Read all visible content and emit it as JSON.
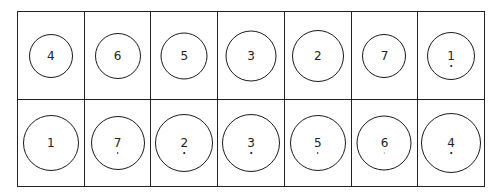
{
  "grid": {
    "rows": [
      {
        "cells": [
          {
            "label": "4",
            "diameter": 44,
            "dot": false
          },
          {
            "label": "6",
            "diameter": 46,
            "dot": false
          },
          {
            "label": "5",
            "diameter": 47,
            "dot": false
          },
          {
            "label": "3",
            "diameter": 51,
            "dot": false
          },
          {
            "label": "2",
            "diameter": 52,
            "dot": false
          },
          {
            "label": "7",
            "diameter": 44,
            "dot": false
          },
          {
            "label": "1",
            "diameter": 48,
            "dot": true
          }
        ]
      },
      {
        "cells": [
          {
            "label": "1",
            "diameter": 56,
            "dot": false
          },
          {
            "label": "7",
            "diameter": 54,
            "dot": true
          },
          {
            "label": "2",
            "diameter": 58,
            "dot": true
          },
          {
            "label": "3",
            "diameter": 58,
            "dot": true
          },
          {
            "label": "5",
            "diameter": 56,
            "dot": true
          },
          {
            "label": "6",
            "diameter": 55,
            "dot": true
          },
          {
            "label": "4",
            "diameter": 60,
            "dot": true
          }
        ]
      }
    ]
  }
}
